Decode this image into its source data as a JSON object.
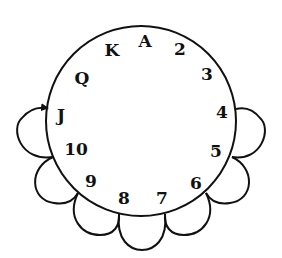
{
  "diagram": {
    "type": "card-clock-cycle",
    "labels": [
      {
        "text": "A",
        "x": 145,
        "y": 47
      },
      {
        "text": "2",
        "x": 180,
        "y": 55
      },
      {
        "text": "3",
        "x": 207,
        "y": 80
      },
      {
        "text": "4",
        "x": 222,
        "y": 118
      },
      {
        "text": "5",
        "x": 216,
        "y": 157
      },
      {
        "text": "6",
        "x": 196,
        "y": 189
      },
      {
        "text": "7",
        "x": 162,
        "y": 204
      },
      {
        "text": "8",
        "x": 124,
        "y": 204
      },
      {
        "text": "9",
        "x": 91,
        "y": 187
      },
      {
        "text": "10",
        "x": 76,
        "y": 155
      },
      {
        "text": "J",
        "x": 61,
        "y": 121
      },
      {
        "text": "Q",
        "x": 82,
        "y": 84
      },
      {
        "text": "K",
        "x": 112,
        "y": 56
      }
    ],
    "loops": [
      {
        "from": "J",
        "to": "10",
        "arrow": true
      },
      {
        "from": "10",
        "to": "9"
      },
      {
        "from": "9",
        "to": "8"
      },
      {
        "from": "8",
        "to": "7"
      },
      {
        "from": "7",
        "to": "6"
      },
      {
        "from": "6",
        "to": "5"
      },
      {
        "from": "5",
        "to": "4"
      }
    ],
    "stroke_color": "#111111"
  }
}
